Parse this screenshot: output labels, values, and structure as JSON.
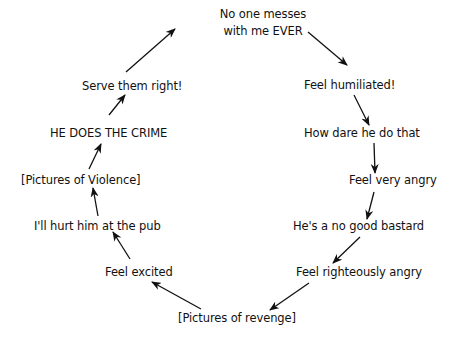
{
  "diagram": {
    "type": "cycle",
    "nodes": [
      {
        "id": "n0",
        "lines": [
          "No one messes",
          "with me EVER"
        ]
      },
      {
        "id": "n1",
        "label": "Feel humiliated!"
      },
      {
        "id": "n2",
        "label": "How dare he do that"
      },
      {
        "id": "n3",
        "label": "Feel very angry"
      },
      {
        "id": "n4",
        "label": "He's a no good bastard"
      },
      {
        "id": "n5",
        "label": "Feel righteously angry"
      },
      {
        "id": "n6",
        "label": "[Pictures of revenge]"
      },
      {
        "id": "n7",
        "label": "Feel excited"
      },
      {
        "id": "n8",
        "label": "I'll hurt him at the pub"
      },
      {
        "id": "n9",
        "label": "[Pictures of Violence]"
      },
      {
        "id": "n10",
        "label": "HE DOES THE CRIME"
      },
      {
        "id": "n11",
        "label": "Serve them right!"
      }
    ],
    "edges": [
      {
        "from": "n0",
        "to": "n1"
      },
      {
        "from": "n1",
        "to": "n2"
      },
      {
        "from": "n2",
        "to": "n3"
      },
      {
        "from": "n3",
        "to": "n4"
      },
      {
        "from": "n4",
        "to": "n5"
      },
      {
        "from": "n5",
        "to": "n6"
      },
      {
        "from": "n6",
        "to": "n7"
      },
      {
        "from": "n7",
        "to": "n8"
      },
      {
        "from": "n8",
        "to": "n9"
      },
      {
        "from": "n9",
        "to": "n10"
      },
      {
        "from": "n10",
        "to": "n11"
      },
      {
        "from": "n11",
        "to": "n0"
      }
    ],
    "colors": {
      "text": "#111111",
      "arrow": "#111111",
      "background": "#ffffff"
    }
  }
}
